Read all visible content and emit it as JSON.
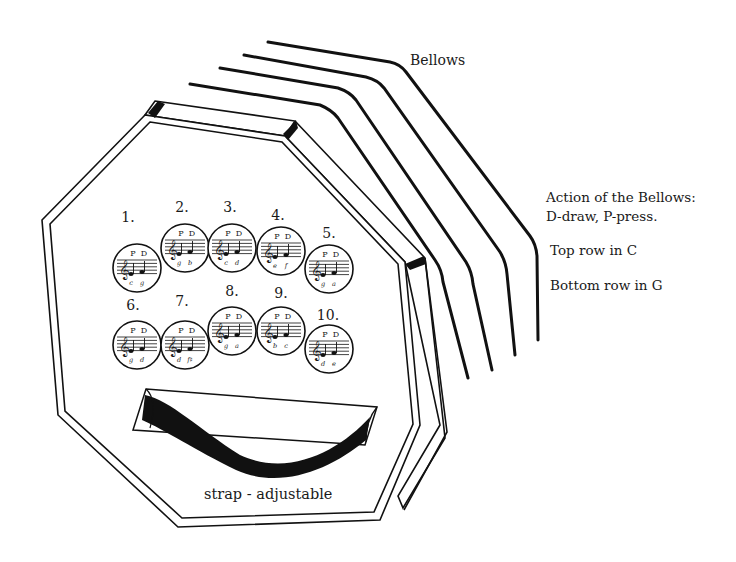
{
  "labels": {
    "bellows": "Bellows",
    "legend_line1": "Action of the Bellows:",
    "legend_line2": "D-draw, P-press.",
    "top_row": "Top row in C",
    "bottom_row": "Bottom row in G",
    "strap": "strap - adjustable"
  },
  "buttons": {
    "top_row": [
      {
        "number": "1.",
        "press": "P",
        "draw": "D",
        "notes": [
          "c",
          "g"
        ]
      },
      {
        "number": "2.",
        "press": "P",
        "draw": "D",
        "notes": [
          "g",
          "b"
        ]
      },
      {
        "number": "3.",
        "press": "P",
        "draw": "D",
        "notes": [
          "c",
          "d"
        ]
      },
      {
        "number": "4.",
        "press": "P",
        "draw": "D",
        "notes": [
          "e",
          "f"
        ]
      },
      {
        "number": "5.",
        "press": "P",
        "draw": "D",
        "notes": [
          "g",
          "a"
        ]
      }
    ],
    "bottom_row": [
      {
        "number": "6.",
        "press": "P",
        "draw": "D",
        "notes": [
          "g",
          "d"
        ]
      },
      {
        "number": "7.",
        "press": "P",
        "draw": "D",
        "notes": [
          "d",
          "f♯"
        ]
      },
      {
        "number": "8.",
        "press": "P",
        "draw": "D",
        "notes": [
          "g",
          "a"
        ]
      },
      {
        "number": "9.",
        "press": "P",
        "draw": "D",
        "notes": [
          "b",
          "c"
        ]
      },
      {
        "number": "10.",
        "press": "P",
        "draw": "D",
        "notes": [
          "d",
          "e"
        ]
      }
    ]
  },
  "colors": {
    "ink": "#111111",
    "paper": "#ffffff"
  }
}
